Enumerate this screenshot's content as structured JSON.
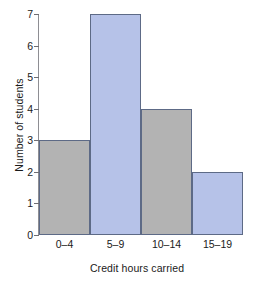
{
  "chart_data": {
    "type": "bar",
    "title": "",
    "subtitle": "",
    "categories": [
      "0–4",
      "5–9",
      "10–14",
      "15–19"
    ],
    "values": [
      3,
      7,
      4,
      2
    ],
    "xlabel": "Credit hours carried",
    "ylabel": "Number of students",
    "ylim": [
      0,
      7
    ],
    "ytick_labels": [
      "0",
      "1",
      "2",
      "3",
      "4",
      "5",
      "6",
      "7"
    ],
    "ytick_values": [
      0,
      1,
      2,
      3,
      4,
      5,
      6,
      7
    ],
    "grid": false,
    "legend": false,
    "legend_position": "none",
    "bar_colors": [
      "#b3b3b3",
      "#b6c2e8",
      "#b3b3b3",
      "#b6c2e8"
    ],
    "bar_edge_color": "#5d6a86",
    "axis_color": "#8e8e93",
    "text_color": "#1a1a1a",
    "background_color": "#ffffff"
  }
}
